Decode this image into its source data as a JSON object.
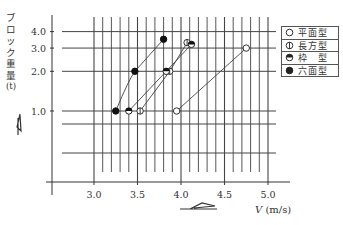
{
  "chart_data": {
    "type": "line",
    "title": "",
    "xlabel": "V (m/s)",
    "ylabel": "ブロック重量 (t)",
    "x_axis": {
      "range": [
        2.6,
        5.1
      ],
      "ticks": [
        3.0,
        3.5,
        4.0,
        4.5,
        5.0
      ],
      "tick_labels": [
        "3.0",
        "3.5",
        "4.0",
        "4.5",
        "5.0"
      ],
      "minor_grid_step": 0.1
    },
    "y_axis": {
      "scale": "log",
      "ticks": [
        1.0,
        2.0,
        3.0,
        4.0
      ],
      "tick_labels": [
        "1.0",
        "2.0",
        "3.0",
        "4.0"
      ]
    },
    "grid": true,
    "legend_position": "upper right",
    "series": [
      {
        "name": "平面型",
        "marker": "open-circle",
        "points": [
          [
            3.95,
            1.0
          ],
          [
            4.75,
            3.0
          ]
        ]
      },
      {
        "name": "長方型",
        "marker": "circle-vertical-bar",
        "points": [
          [
            3.53,
            1.0
          ],
          [
            3.87,
            2.0
          ],
          [
            4.07,
            3.3
          ]
        ]
      },
      {
        "name": "枠 型",
        "marker": "half-filled-circle",
        "points": [
          [
            3.4,
            1.0
          ],
          [
            3.83,
            2.0
          ],
          [
            4.12,
            3.2
          ]
        ]
      },
      {
        "name": "六面型",
        "marker": "filled-circle",
        "points": [
          [
            3.25,
            1.0
          ],
          [
            3.47,
            2.0
          ],
          [
            3.8,
            3.5
          ]
        ]
      }
    ]
  },
  "labels": {
    "ylabel_chars": [
      "ブ",
      "ロ",
      "ッ",
      "ク",
      "重",
      "量",
      "(t)"
    ],
    "xlabel_var": "V",
    "xlabel_unit": "(m/s)"
  },
  "legend": [
    {
      "label": "平面型",
      "marker": "open-circle"
    },
    {
      "label": "長方型",
      "marker": "circle-vertical-bar"
    },
    {
      "label": "枠　型",
      "marker": "half-filled-circle"
    },
    {
      "label": "六面型",
      "marker": "filled-circle"
    }
  ]
}
